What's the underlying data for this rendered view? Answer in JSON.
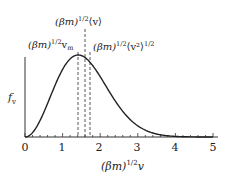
{
  "chart_data": {
    "type": "line",
    "title": "",
    "xlabel": "(βm)^1/2 v",
    "ylabel": "f_v",
    "xlim": [
      0,
      5
    ],
    "xticks": [
      "0",
      "1",
      "2",
      "3",
      "4",
      "5"
    ],
    "grid": false,
    "legend": null,
    "series": [
      {
        "name": "Maxwell speed distribution f_v",
        "x": [
          0,
          0.25,
          0.5,
          0.75,
          1.0,
          1.25,
          1.414,
          1.6,
          1.75,
          2.0,
          2.25,
          2.5,
          2.75,
          3.0,
          3.25,
          3.5,
          3.75,
          4.0,
          4.5,
          5.0
        ],
        "y": [
          0,
          0.08,
          0.29,
          0.56,
          0.82,
          0.98,
          1.0,
          0.97,
          0.91,
          0.74,
          0.54,
          0.37,
          0.23,
          0.13,
          0.07,
          0.03,
          0.015,
          0.006,
          0.0,
          0.0
        ]
      }
    ],
    "annotations": [
      {
        "label_base": "(βm)",
        "label_sup": "1/2",
        "label_tail": "v",
        "label_sub": "m",
        "x": 1.414,
        "style": "dashed"
      },
      {
        "label_base": "(βm)",
        "label_sup": "1/2",
        "label_tail": "⟨v⟩",
        "x": 1.596,
        "style": "dashed"
      },
      {
        "label_base": "(βm)",
        "label_sup": "1/2",
        "label_tail": "⟨v²⟩",
        "label_sup2": "1/2",
        "x": 1.732,
        "style": "dashed"
      }
    ]
  },
  "labels": {
    "ylabel_main": "f",
    "ylabel_sub": "v",
    "xlabel_main": "(βm)",
    "xlabel_sup": "1/2",
    "xlabel_tail": "v",
    "ann_vm_main": "(βm)",
    "ann_vm_sup": "1/2",
    "ann_vm_tail": "v",
    "ann_vm_sub": "m",
    "ann_mean_main": "(βm)",
    "ann_mean_sup": "1/2",
    "ann_mean_tail": "⟨v⟩",
    "ann_rms_main": "(βm)",
    "ann_rms_sup": "1/2",
    "ann_rms_tail": "⟨v²⟩",
    "ann_rms_sup2": "1/2",
    "tick0": "0",
    "tick1": "1",
    "tick2": "2",
    "tick3": "3",
    "tick4": "4",
    "tick5": "5"
  }
}
